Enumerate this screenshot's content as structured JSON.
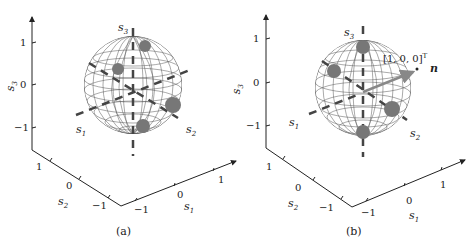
{
  "figure": {
    "panels": [
      {
        "id": "a",
        "caption": "(a)",
        "axes": {
          "vertical": {
            "label": "s3",
            "ticks": [
              "1",
              "0",
              "−1"
            ]
          },
          "depth": {
            "label": "s2",
            "ticks": [
              "1",
              "0",
              "−1"
            ]
          },
          "horizontal": {
            "label": "s1",
            "ticks": [
              "−1",
              "0",
              "1"
            ]
          }
        },
        "sphere_labels": {
          "top": "s3",
          "left": "s1",
          "right": "s2"
        },
        "clusters": 4
      },
      {
        "id": "b",
        "caption": "(b)",
        "axes": {
          "vertical": {
            "label": "s3",
            "ticks": [
              "1",
              "0",
              "−1"
            ]
          },
          "depth": {
            "label": "s2",
            "ticks": [
              "1",
              "0",
              "−1"
            ]
          },
          "horizontal": {
            "label": "s1",
            "ticks": [
              "−1",
              "0",
              "1"
            ]
          }
        },
        "sphere_labels": {
          "top": "s3",
          "left": "s1",
          "right": "s2"
        },
        "annotation_vector": "[1, 0, 0]",
        "annotation_vector_sup": "T",
        "normal_label": "n",
        "clusters": 4
      }
    ]
  },
  "colors": {
    "axis": "#222222",
    "mesh": "#555555",
    "cluster": "#777777",
    "dashes": "#444444",
    "arrow": "#888888"
  }
}
